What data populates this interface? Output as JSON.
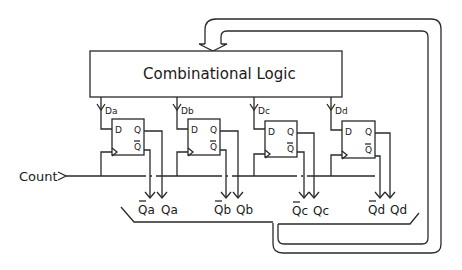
{
  "diagram": {
    "type": "synchronous-counter-schematic",
    "logic_block": {
      "label": "Combinational Logic"
    },
    "clock_input": {
      "label": "Count"
    },
    "flip_flops": [
      {
        "id": "a",
        "d_label": "Da",
        "pin_d": "D",
        "pin_q": "Q",
        "pin_qbar": "Q",
        "qbar_out": "Qa",
        "q_out": "Qa"
      },
      {
        "id": "b",
        "d_label": "Db",
        "pin_d": "D",
        "pin_q": "Q",
        "pin_qbar": "Q",
        "qbar_out": "Qb",
        "q_out": "Qb"
      },
      {
        "id": "c",
        "d_label": "Dc",
        "pin_d": "D",
        "pin_q": "Q",
        "pin_qbar": "Q",
        "qbar_out": "Qc",
        "q_out": "Qc"
      },
      {
        "id": "d",
        "d_label": "Dd",
        "pin_d": "D",
        "pin_q": "Q",
        "pin_qbar": "Q",
        "qbar_out": "Qd",
        "q_out": "Qd"
      }
    ],
    "feedback": {
      "description": "output bus fed back to combinational logic"
    },
    "colors": {
      "line": "#2a2a2a",
      "background": "#ffffff"
    }
  }
}
